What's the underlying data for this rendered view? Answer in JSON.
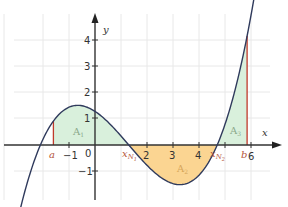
{
  "chart_data": {
    "type": "line",
    "title": "",
    "xlabel": "x",
    "ylabel": "y",
    "function": "f(x) = 0.1 (x + 2.1)(x - 1.3)(x - 4.7)",
    "xlim": [
      -3.6,
      6.7
    ],
    "ylim": [
      -2.4,
      5.5
    ],
    "grid": true,
    "x_ticks": [
      {
        "value": -1,
        "label": "-1"
      },
      {
        "value": 0,
        "label": "0"
      },
      {
        "value": 2,
        "label": "2"
      },
      {
        "value": 3,
        "label": "3"
      },
      {
        "value": 4,
        "label": "4"
      },
      {
        "value": 6,
        "label": "6"
      }
    ],
    "y_ticks": [
      {
        "value": -1,
        "label": "-1"
      },
      {
        "value": 1,
        "label": "1"
      },
      {
        "value": 2,
        "label": "2"
      },
      {
        "value": 3,
        "label": "3"
      },
      {
        "value": 4,
        "label": "4"
      }
    ],
    "annotations": {
      "a": {
        "label": "a",
        "x": -1.6
      },
      "b": {
        "label": "b",
        "x": 5.85
      },
      "zeros": [
        {
          "label": "x",
          "sub": "N1",
          "x": 1.3
        },
        {
          "label": "x",
          "sub": "N2",
          "x": 4.7
        }
      ],
      "areas": [
        {
          "label": "A",
          "sub": "1",
          "from": -1.6,
          "to": 1.3,
          "color": "#d9f0dc"
        },
        {
          "label": "A",
          "sub": "2",
          "from": 1.3,
          "to": 4.7,
          "color": "#fbd592"
        },
        {
          "label": "A",
          "sub": "3",
          "from": 4.7,
          "to": 5.85,
          "color": "#d9f0dc"
        }
      ]
    },
    "colors": {
      "curve": "#2f3a5c",
      "axis": "#333333",
      "grid": "#e6e6e6",
      "bound_line": "#c0392b",
      "area_positive": "#d9f0dc",
      "area_negative": "#fbd592"
    }
  },
  "labels": {
    "y_axis": "y",
    "x_axis": "x",
    "a": "a",
    "b": "b",
    "xN": "x",
    "N1": "N",
    "N1_sub": "1",
    "N2": "N",
    "N2_sub": "2",
    "A": "A",
    "A1_sub": "1",
    "A2_sub": "2",
    "A3_sub": "3",
    "t_m1x": "−1",
    "t_0": "0",
    "t_2": "2",
    "t_3": "3",
    "t_4": "4",
    "t_6": "6",
    "t_4y": "4",
    "t_3y": "3",
    "t_2y": "2",
    "t_1y": "1",
    "t_m1y": "−1"
  }
}
